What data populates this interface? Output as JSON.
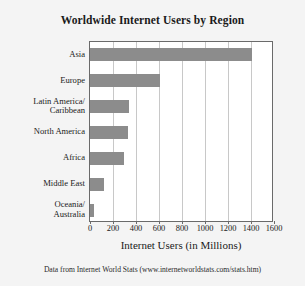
{
  "chart_data": {
    "type": "bar",
    "orientation": "horizontal",
    "title": "Worldwide Internet Users by Region",
    "xlabel": "Internet Users (in Millions)",
    "ylabel": "",
    "xlim": [
      0,
      1600
    ],
    "xticks": [
      0,
      200,
      400,
      600,
      800,
      1000,
      1200,
      1400,
      1600
    ],
    "xtick_labels": [
      "0",
      "200",
      "400",
      "600",
      "800",
      "1000",
      "1200",
      "1400",
      "1600"
    ],
    "grid": true,
    "grid_axis": "x",
    "legend": false,
    "categories": [
      "Asia",
      "Europe",
      "Latin America/\nCaribbean",
      "North America",
      "Africa",
      "Middle East",
      "Oceania/\nAustralia"
    ],
    "category_lines": [
      [
        "Asia"
      ],
      [
        "Europe"
      ],
      [
        "Latin America/",
        "Caribbean"
      ],
      [
        "North America"
      ],
      [
        "Africa"
      ],
      [
        "Middle East"
      ],
      [
        "Oceania/",
        "Australia"
      ]
    ],
    "values": [
      1400,
      600,
      330,
      320,
      290,
      110,
      25
    ],
    "bar_color": "#8c8c8c",
    "plot_background": "#ffffff",
    "figure_background": "#f4f4f4",
    "axis_color": "#6a6a6a",
    "gridline_color": "#c8c8c8"
  },
  "source_note": "Data from Internet World Stats (www.internetworldstats.com/stats.htm)"
}
